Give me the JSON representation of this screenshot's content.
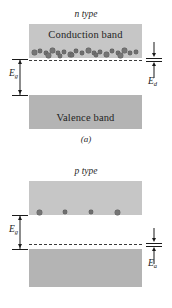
{
  "figure": {
    "title_a": "n type",
    "title_b": "p type",
    "panel_a_label": "(a)",
    "panel_b_label": "(b)",
    "band_labels": {
      "conduction": "Conduction band",
      "valence": "Valence band"
    },
    "energy_labels": {
      "gap_symbol": "E",
      "gap_subscript": "g",
      "donor_symbol": "E",
      "donor_subscript": "d",
      "acceptor_symbol": "E",
      "acceptor_subscript": "a"
    },
    "colors": {
      "band_dark": "#b4b4b4",
      "band_light": "#c6c6c6",
      "electron": "#6e6e6e",
      "hole": "#ffffff",
      "line": "#1a1a1a",
      "background": "#ffffff"
    }
  },
  "chart_data": {
    "type": "diagram",
    "panels": [
      {
        "id": "a",
        "label": "(a)",
        "title": "n type",
        "bands": [
          {
            "name": "Conduction band",
            "role": "conduction",
            "top_px": 24,
            "height_px": 34
          },
          {
            "name": "Valence band",
            "role": "valence",
            "top_px": 95,
            "height_px": 34
          }
        ],
        "impurity_level": {
          "name": "donor",
          "symbol": "Ed",
          "y_px": 62,
          "style": "dashed"
        },
        "gap_label": "Eg",
        "gap_label_side": "left",
        "impurity_label_side": "right",
        "carriers": {
          "electrons_in_conduction_band": 23,
          "holes_in_valence_band": 4
        }
      },
      {
        "id": "b",
        "label": "(b)",
        "title": "p type",
        "bands": [
          {
            "name": "Conduction band",
            "role": "conduction",
            "top_px": 27,
            "height_px": 34
          },
          {
            "name": "Valence band",
            "role": "valence",
            "top_px": 95,
            "height_px": 38
          }
        ],
        "impurity_level": {
          "name": "acceptor",
          "symbol": "Ea",
          "y_px": 91,
          "style": "dashed"
        },
        "gap_label": "Eg",
        "gap_label_side": "left",
        "impurity_label_side": "right",
        "carriers": {
          "electrons_in_conduction_band": 4,
          "holes_in_valence_band": 22
        }
      }
    ],
    "electron_positions_a": [
      [
        32,
        2
      ],
      [
        38,
        1
      ],
      [
        44,
        3
      ],
      [
        50,
        0
      ],
      [
        56,
        3
      ],
      [
        62,
        2
      ],
      [
        68,
        4
      ],
      [
        74,
        1
      ],
      [
        80,
        3
      ],
      [
        86,
        0
      ],
      [
        92,
        3
      ],
      [
        98,
        2
      ],
      [
        104,
        4
      ],
      [
        110,
        1
      ],
      [
        116,
        3
      ],
      [
        122,
        0
      ],
      [
        128,
        3
      ],
      [
        134,
        2
      ],
      [
        46,
        5
      ],
      [
        70,
        5
      ],
      [
        94,
        5
      ],
      [
        118,
        5
      ],
      [
        58,
        6
      ]
    ],
    "hole_positions_a": [
      [
        42,
        0
      ],
      [
        67,
        0
      ],
      [
        94,
        0
      ],
      [
        120,
        0
      ]
    ],
    "electron_positions_b": [
      [
        37,
        0
      ],
      [
        63,
        0
      ],
      [
        89,
        0
      ],
      [
        115,
        0
      ]
    ],
    "hole_positions_b": [
      [
        33,
        3
      ],
      [
        39,
        1
      ],
      [
        45,
        4
      ],
      [
        51,
        2
      ],
      [
        57,
        5
      ],
      [
        63,
        1
      ],
      [
        69,
        3
      ],
      [
        75,
        0
      ],
      [
        81,
        4
      ],
      [
        87,
        2
      ],
      [
        93,
        5
      ],
      [
        99,
        1
      ],
      [
        105,
        3
      ],
      [
        111,
        0
      ],
      [
        117,
        4
      ],
      [
        123,
        2
      ],
      [
        129,
        3
      ],
      [
        135,
        1
      ],
      [
        48,
        7
      ],
      [
        78,
        7
      ],
      [
        108,
        7
      ],
      [
        126,
        6
      ]
    ]
  }
}
